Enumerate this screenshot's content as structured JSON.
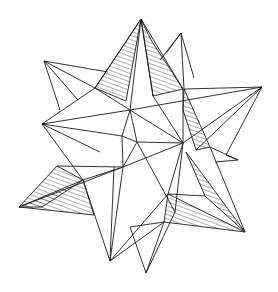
{
  "figure": {
    "style": "black ink outlines with horizontal/diagonal hatching on shaded faces",
    "ink_color": "#1a1a1a",
    "background_color": "#ffffff"
  }
}
